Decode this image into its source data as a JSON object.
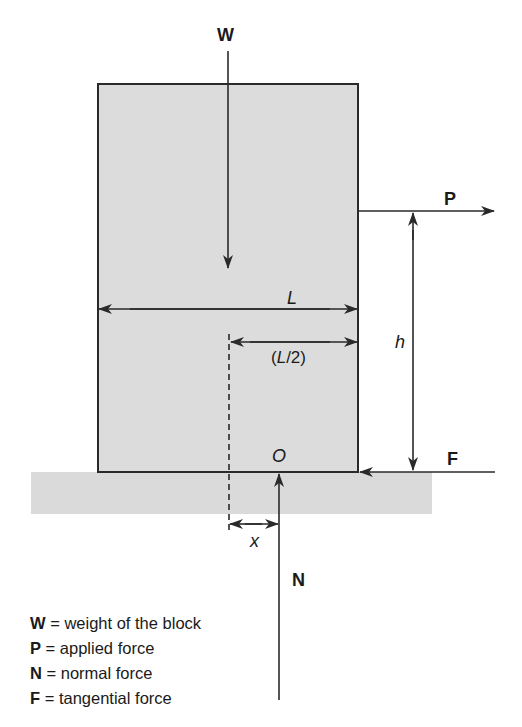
{
  "diagram": {
    "colors": {
      "block_fill": "#dcdcdc",
      "ground_fill": "#dadada",
      "line": "#2a2a2a",
      "text": "#1a1a1a"
    },
    "labels": {
      "weight": "W",
      "applied": "P",
      "normal": "N",
      "tangential": "F",
      "length": "L",
      "half_length": "(L/2)",
      "height": "h",
      "origin": "O",
      "offset": "x"
    },
    "legend": [
      {
        "symbol": "W",
        "eq": " = ",
        "text": "weight of the block"
      },
      {
        "symbol": "P",
        "eq": " = ",
        "text": "applied force"
      },
      {
        "symbol": "N",
        "eq": " = ",
        "text": "normal force"
      },
      {
        "symbol": "F",
        "eq": " = ",
        "text": "tangential force"
      }
    ]
  }
}
